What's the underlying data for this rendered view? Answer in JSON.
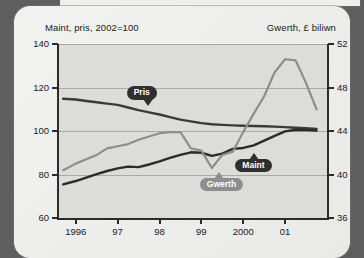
{
  "header": {
    "left_axis_title": "Maint, pris, 2002=100",
    "right_axis_title": "Gwerth, £ biliwn"
  },
  "colors": {
    "background": "#5e5e5e",
    "panel": "#eeeeec",
    "plot_background": "#dcdcda",
    "gridline": "#a9a9a7",
    "axis": "#2b2b2b",
    "pris_line": "#3a3a3a",
    "maint_line": "#2b2b2b",
    "gwerth_line": "#8e8e8e",
    "callout_dark": "#2f2f2f",
    "callout_light": "#8e8e8e"
  },
  "callouts": [
    {
      "name": "pris",
      "label": "Pris"
    },
    {
      "name": "maint",
      "label": "Maint"
    },
    {
      "name": "gwerth",
      "label": "Gwerth"
    }
  ],
  "chart_data": {
    "type": "line",
    "title": "",
    "subtitle": "",
    "xlabel": "",
    "ylabel": "Maint, pris, 2002=100",
    "y2label": "Gwerth, £ biliwn",
    "grid": true,
    "legend": "inline-callouts",
    "xlim": [
      1995.6,
      2002.0
    ],
    "ylim": [
      60,
      140
    ],
    "y2lim": [
      36,
      52
    ],
    "yticks": [
      60,
      80,
      100,
      120,
      140
    ],
    "y2ticks": [
      36,
      40,
      44,
      48,
      52
    ],
    "xticks": [
      1996,
      1997,
      1998,
      1999,
      2000,
      2001
    ],
    "xticklabels": [
      "1996",
      "97",
      "98",
      "99",
      "2000",
      "01"
    ],
    "series": [
      {
        "name": "Pris",
        "axis": "left",
        "color": "#3a3a3a",
        "x": [
          1995.7,
          1996.0,
          1996.25,
          1996.5,
          1996.75,
          1997.0,
          1997.25,
          1997.5,
          1997.75,
          1998.0,
          1998.25,
          1998.5,
          1998.75,
          1999.0,
          1999.25,
          1999.5,
          1999.75,
          2000.0,
          2000.25,
          2000.5,
          2000.75,
          2001.0,
          2001.25,
          2001.5,
          2001.75
        ],
        "values": [
          114.8,
          114.5,
          113.8,
          113.2,
          112.6,
          112.0,
          110.8,
          109.6,
          108.6,
          107.6,
          106.4,
          105.2,
          104.4,
          103.6,
          103.1,
          102.8,
          102.6,
          102.4,
          102.3,
          102.2,
          102.0,
          101.8,
          101.5,
          101.3,
          101.0
        ]
      },
      {
        "name": "Maint",
        "axis": "left",
        "color": "#2b2b2b",
        "x": [
          1995.7,
          1996.0,
          1996.25,
          1996.5,
          1996.75,
          1997.0,
          1997.25,
          1997.5,
          1997.75,
          1998.0,
          1998.25,
          1998.5,
          1998.75,
          1999.0,
          1999.25,
          1999.5,
          1999.75,
          2000.0,
          2000.25,
          2000.5,
          2000.75,
          2001.0,
          2001.25,
          2001.5,
          2001.75
        ],
        "values": [
          75.5,
          77.0,
          78.6,
          80.2,
          81.6,
          82.8,
          83.6,
          83.4,
          84.6,
          86.0,
          87.6,
          89.0,
          90.2,
          90.0,
          88.6,
          89.6,
          91.8,
          92.2,
          93.4,
          95.6,
          97.8,
          99.8,
          100.6,
          100.4,
          100.2
        ],
        "note": "dips around 1999 then rises to ~100 by 2002"
      },
      {
        "name": "Gwerth",
        "axis": "right",
        "color": "#8e8e8e",
        "x": [
          1995.7,
          1996.0,
          1996.25,
          1996.5,
          1996.75,
          1997.0,
          1997.25,
          1997.5,
          1997.75,
          1998.0,
          1998.25,
          1998.5,
          1998.75,
          1999.0,
          1999.25,
          1999.5,
          1999.75,
          2000.0,
          2000.25,
          2000.5,
          2000.75,
          2001.0,
          2001.25,
          2001.5,
          2001.75
        ],
        "values": [
          40.4,
          41.0,
          41.4,
          41.8,
          42.4,
          42.6,
          42.8,
          43.2,
          43.5,
          43.8,
          43.9,
          43.9,
          42.4,
          42.2,
          40.6,
          41.8,
          42.1,
          43.9,
          45.6,
          47.2,
          49.4,
          50.6,
          50.5,
          48.4,
          46.0
        ],
        "note": "sharp trough near 1999.25 then strong peak ~50.6 at 2001"
      }
    ]
  }
}
